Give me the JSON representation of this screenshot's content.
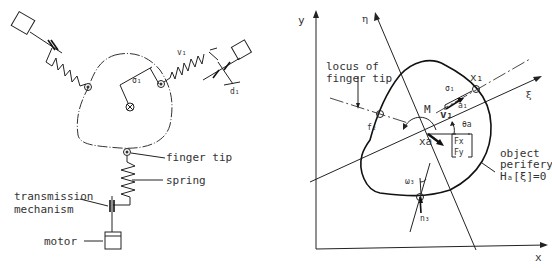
{
  "left_diagram": {
    "labels": {
      "finger_tip": "finger tip",
      "spring": "spring",
      "transmission_line1": "transmission",
      "transmission_line2": "mechanism",
      "motor": "motor",
      "v1": "v₁",
      "sigma1": "σ₁",
      "d1": "d₁"
    }
  },
  "right_diagram": {
    "axes": {
      "x": "x",
      "y": "y",
      "eta": "η",
      "xi": "ξ"
    },
    "labels": {
      "locus_line1": "locus of",
      "locus_line2": "finger tip",
      "x1": "x₁",
      "sigma1": "σ₁",
      "M": "M",
      "v1": "v₁",
      "a1": "a₁",
      "theta_a": "θa",
      "f2": "f₂",
      "xa": "xa",
      "Fx": "Fx",
      "Fy": "Fy",
      "object_line1": "object",
      "object_line2": "perifery",
      "object_line3": "Hₐ[ξ]=0",
      "omega3": "ω₃",
      "n3": "n₃"
    }
  }
}
